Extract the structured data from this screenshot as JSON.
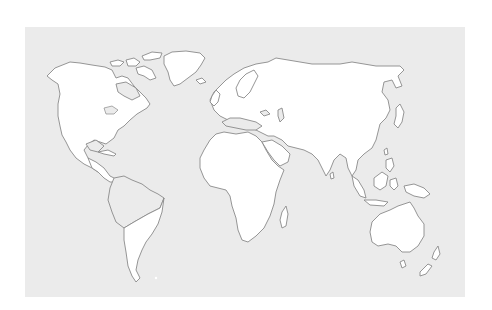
{
  "map": {
    "title": "",
    "type": "blank world outline map",
    "colors": {
      "page_background": "#ffffff",
      "ocean": "#ebebeb",
      "land": "#ffffff",
      "outline": "#8a8a8a"
    },
    "panel": {
      "x": 25,
      "y": 27,
      "width": 440,
      "height": 270
    },
    "landmasses": [
      {
        "name": "north-america",
        "style": "land",
        "d": "M47,76 L55,68 L70,62 L80,63 L92,65 L105,67 L112,70 L116,78 L122,76 L128,78 L134,86 L140,92 L146,98 L150,104 L147,108 L142,111 L137,114 L130,120 L124,126 L118,130 L114,138 L110,141 L106,144 L100,142 L94,140 L88,145 L84,150 L88,158 L94,164 L100,166 L104,170 L98,172 L92,168 L84,164 L76,158 L70,150 L66,142 L62,135 L60,126 L58,116 L58,104 L60,94 L58,84 L52,80 Z"
      },
      {
        "name": "central-america",
        "style": "land",
        "d": "M88,158 L96,162 L104,168 L110,176 L114,178 L118,182 L110,182 L104,178 L98,172 L92,168 Z"
      },
      {
        "name": "greenland",
        "style": "land",
        "d": "M164,56 L172,52 L186,51 L200,53 L205,58 L201,65 L196,72 L188,78 L180,84 L174,86 L170,80 L168,72 L164,64 Z"
      },
      {
        "name": "arctic-islands-1",
        "style": "land",
        "d": "M110,62 L118,60 L124,62 L120,66 L112,66 Z"
      },
      {
        "name": "arctic-islands-2",
        "style": "land",
        "d": "M126,60 L134,58 L140,62 L136,66 L128,66 Z"
      },
      {
        "name": "arctic-islands-3",
        "style": "land",
        "d": "M142,56 L152,52 L162,53 L160,58 L150,60 L144,60 Z"
      },
      {
        "name": "baffin-island",
        "style": "land",
        "d": "M136,68 L144,66 L152,70 L156,78 L150,80 L144,76 L138,74 Z"
      },
      {
        "name": "south-america-north",
        "style": "land-gray",
        "d": "M114,178 L124,176 L132,180 L142,184 L150,190 L158,194 L164,198 L160,208 L148,214 L134,222 L124,228 L116,222 L112,212 L108,200 L110,188 Z"
      },
      {
        "name": "south-america-south",
        "style": "land",
        "d": "M124,228 L134,222 L148,214 L160,208 L164,198 L162,212 L158,224 L152,234 L146,242 L142,250 L138,260 L136,270 L140,278 L136,282 L132,276 L128,266 L126,252 L124,240 Z"
      },
      {
        "name": "eurasia",
        "style": "land",
        "d": "M210,100 L214,92 L220,86 L226,80 L234,74 L244,68 L256,64 L268,62 L276,58 L288,60 L300,62 L312,64 L326,64 L340,64 L352,62 L364,64 L376,66 L388,66 L400,66 L404,70 L398,76 L402,86 L396,88 L392,80 L384,82 L382,92 L388,100 L390,110 L386,118 L380,124 L378,132 L376,140 L372,148 L364,154 L358,160 L356,170 L352,176 L348,168 L346,158 L340,154 L334,160 L330,170 L326,176 L322,168 L318,160 L312,154 L304,150 L296,148 L288,146 L282,140 L274,136 L268,136 L260,132 L252,128 L244,124 L236,122 L228,120 L220,116 L214,110 Z"
      },
      {
        "name": "scandinavia",
        "style": "land",
        "d": "M236,88 L240,80 L246,74 L254,70 L258,76 L254,84 L250,92 L244,98 L238,96 Z"
      },
      {
        "name": "great-britain",
        "style": "land",
        "d": "M212,96 L216,90 L220,94 L218,102 L214,106 L210,102 Z"
      },
      {
        "name": "iceland",
        "style": "land",
        "d": "M196,80 L202,78 L206,82 L200,84 Z"
      },
      {
        "name": "africa",
        "style": "land",
        "d": "M204,150 L210,140 L216,134 L224,132 L236,134 L248,132 L256,136 L262,142 L266,150 L272,160 L278,166 L284,170 L280,180 L276,192 L274,204 L270,216 L264,228 L256,236 L248,242 L242,240 L238,230 L236,218 L232,206 L230,196 L226,190 L218,188 L210,186 L204,178 L200,168 L200,158 Z"
      },
      {
        "name": "madagascar",
        "style": "land",
        "d": "M282,212 L286,206 L288,214 L286,226 L282,228 L280,220 Z"
      },
      {
        "name": "arabian-peninsula",
        "style": "land",
        "d": "M262,142 L272,140 L282,146 L290,154 L288,162 L280,166 L274,160 L268,152 Z"
      },
      {
        "name": "sri-lanka",
        "style": "land",
        "d": "M330,174 L333,172 L334,178 L331,179 Z"
      },
      {
        "name": "japan",
        "style": "land",
        "d": "M396,108 L400,104 L404,112 L402,122 L398,128 L394,124 L396,116 Z"
      },
      {
        "name": "taiwan",
        "style": "land",
        "d": "M384,150 L387,148 L388,154 L385,155 Z"
      },
      {
        "name": "philippines",
        "style": "land",
        "d": "M386,160 L392,158 L394,166 L390,172 L386,168 Z"
      },
      {
        "name": "sumatra",
        "style": "land",
        "d": "M352,176 L358,180 L364,190 L366,198 L360,196 L354,186 Z"
      },
      {
        "name": "java",
        "style": "land",
        "d": "M364,200 L376,200 L388,202 L384,206 L370,205 Z"
      },
      {
        "name": "borneo",
        "style": "land",
        "d": "M374,178 L382,172 L388,176 L386,186 L380,190 L374,186 Z"
      },
      {
        "name": "sulawesi",
        "style": "land",
        "d": "M390,180 L396,178 L398,186 L394,190 L390,186 Z"
      },
      {
        "name": "new-guinea",
        "style": "land",
        "d": "M404,186 L414,184 L424,188 L430,194 L424,198 L414,196 L406,192 Z"
      },
      {
        "name": "australia",
        "style": "land",
        "d": "M372,222 L380,214 L390,210 L398,206 L404,204 L410,202 L414,208 L418,216 L424,224 L424,236 L418,246 L410,252 L402,252 L396,246 L388,244 L378,246 L372,242 L370,232 Z"
      },
      {
        "name": "tasmania",
        "style": "land",
        "d": "M400,262 L404,260 L406,266 L402,268 Z"
      },
      {
        "name": "new-zealand-north",
        "style": "land",
        "d": "M434,252 L438,246 L440,254 L436,260 L432,258 Z"
      },
      {
        "name": "new-zealand-south",
        "style": "land",
        "d": "M420,272 L428,264 L432,266 L426,274 L420,276 Z"
      },
      {
        "name": "cuba",
        "style": "land",
        "d": "M98,152 L108,150 L116,154 L114,156 L104,154 Z"
      },
      {
        "name": "mediterranean-sea",
        "style": "land-gray",
        "d": "M222,122 L230,118 L240,118 L248,120 L256,122 L262,126 L256,130 L246,130 L236,128 L226,126 Z"
      },
      {
        "name": "black-sea",
        "style": "land-gray",
        "d": "M260,112 L266,110 L270,114 L264,116 Z"
      },
      {
        "name": "caspian-sea",
        "style": "land-gray",
        "d": "M278,110 L282,108 L284,118 L280,122 L278,116 Z"
      },
      {
        "name": "hudson-bay",
        "style": "land-gray",
        "d": "M116,84 L126,82 L136,88 L140,96 L132,100 L124,96 L118,92 Z"
      },
      {
        "name": "gulf-of-mexico",
        "style": "land-gray",
        "d": "M86,144 L96,140 L104,146 L98,152 L90,150 Z"
      }
    ],
    "lakes": [
      {
        "name": "great-lakes",
        "d": "M104,108 L112,106 L118,110 L114,114 L106,114 Z"
      }
    ],
    "markers": [
      {
        "name": "small-dot-south-atlantic",
        "cx": 156,
        "cy": 278,
        "r": 1.2
      }
    ]
  }
}
